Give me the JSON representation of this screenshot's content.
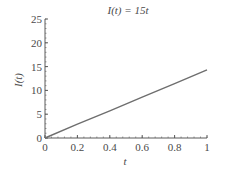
{
  "chart_data": {
    "type": "line",
    "title": "I(t) = 15t",
    "xlabel": "t",
    "ylabel": "I(t)",
    "xlim": [
      0,
      1
    ],
    "ylim": [
      0,
      25
    ],
    "x_ticks": [
      "0",
      "0.2",
      "0.4",
      "0.6",
      "0.8",
      "1"
    ],
    "y_ticks": [
      "0",
      "5",
      "10",
      "15",
      "20",
      "25"
    ],
    "grid": false,
    "legend": null,
    "series": [
      {
        "name": "I(t) = 15t",
        "x": [
          0,
          0.2,
          0.4,
          0.6,
          0.8,
          1.0
        ],
        "values": [
          0,
          2.9,
          5.7,
          8.6,
          11.4,
          14.3
        ]
      }
    ]
  },
  "colors": {
    "line": "#6e6e6e",
    "axis": "#5a5a5a",
    "text": "#4a4a4a"
  }
}
